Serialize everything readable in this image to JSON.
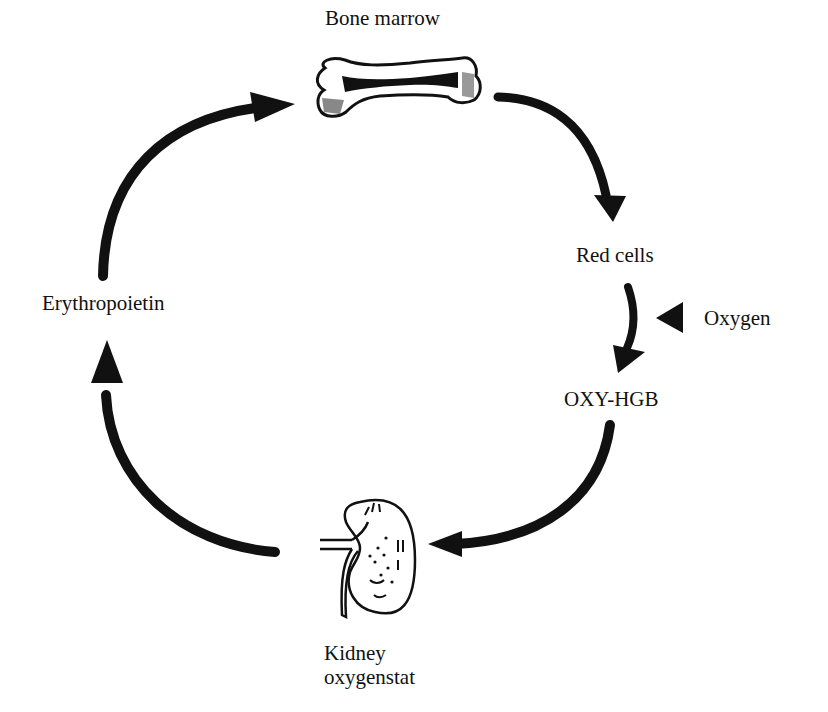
{
  "nodes": {
    "bone_marrow": {
      "label": "Bone marrow",
      "icon": "bone-icon"
    },
    "red_cells": {
      "label": "Red cells"
    },
    "oxygen": {
      "label": "Oxygen",
      "icon": "triangle-left-icon"
    },
    "oxy_hgb": {
      "label": "OXY-HGB"
    },
    "kidney": {
      "line1": "Kidney",
      "line2": "oxygenstat",
      "icon": "kidney-icon"
    },
    "erythropoietin": {
      "label": "Erythropoietin"
    }
  },
  "edges": [
    {
      "from": "Bone marrow",
      "to": "Red cells"
    },
    {
      "from": "Red cells",
      "to": "OXY-HGB"
    },
    {
      "from": "Oxygen",
      "to": "OXY-HGB"
    },
    {
      "from": "OXY-HGB",
      "to": "Kidney oxygenstat"
    },
    {
      "from": "Kidney oxygenstat",
      "to": "Erythropoietin"
    },
    {
      "from": "Erythropoietin",
      "to": "Bone marrow"
    }
  ],
  "colors": {
    "ink": "#111111",
    "background": "#ffffff"
  }
}
